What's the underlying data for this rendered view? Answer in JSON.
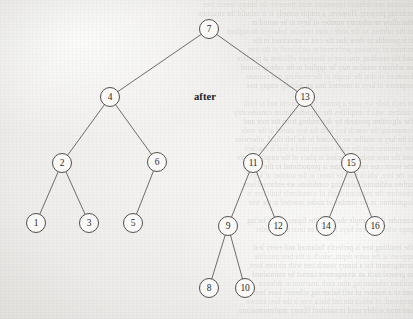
{
  "figure": {
    "caption_label": "after",
    "caption_x": 205,
    "caption_y": 91,
    "background_color": "#f2f1ef",
    "ink_color": "#3f3d3a",
    "node_fill": "#fbfaf8",
    "node_radius": 9.5
  },
  "chart_data": {
    "type": "diagram",
    "diagram_kind": "binary-search-tree",
    "title": "after",
    "node_count": 16,
    "root": 7,
    "nodes": [
      {
        "id": "n7",
        "label": "7",
        "x": 209,
        "y": 29,
        "depth": 0
      },
      {
        "id": "n4",
        "label": "4",
        "x": 110,
        "y": 97,
        "depth": 1
      },
      {
        "id": "n13",
        "label": "13",
        "x": 305,
        "y": 97,
        "depth": 1
      },
      {
        "id": "n2",
        "label": "2",
        "x": 62,
        "y": 163,
        "depth": 2
      },
      {
        "id": "n6",
        "label": "6",
        "x": 157,
        "y": 162,
        "depth": 2
      },
      {
        "id": "n11",
        "label": "11",
        "x": 253,
        "y": 163,
        "depth": 2
      },
      {
        "id": "n15",
        "label": "15",
        "x": 351,
        "y": 163,
        "depth": 2
      },
      {
        "id": "n1",
        "label": "1",
        "x": 36,
        "y": 223,
        "depth": 3
      },
      {
        "id": "n3",
        "label": "3",
        "x": 89,
        "y": 223,
        "depth": 3
      },
      {
        "id": "n5",
        "label": "5",
        "x": 133,
        "y": 223,
        "depth": 3
      },
      {
        "id": "n9",
        "label": "9",
        "x": 228,
        "y": 226,
        "depth": 3
      },
      {
        "id": "n12",
        "label": "12",
        "x": 278,
        "y": 226,
        "depth": 3
      },
      {
        "id": "n14",
        "label": "14",
        "x": 326,
        "y": 226,
        "depth": 3
      },
      {
        "id": "n16",
        "label": "16",
        "x": 375,
        "y": 226,
        "depth": 3
      },
      {
        "id": "n8",
        "label": "8",
        "x": 209,
        "y": 288,
        "depth": 4
      },
      {
        "id": "n10",
        "label": "10",
        "x": 245,
        "y": 288,
        "depth": 4
      }
    ],
    "edges": [
      {
        "from": "n7",
        "to": "n4",
        "side": "left"
      },
      {
        "from": "n7",
        "to": "n13",
        "side": "right"
      },
      {
        "from": "n4",
        "to": "n2",
        "side": "left"
      },
      {
        "from": "n4",
        "to": "n6",
        "side": "right"
      },
      {
        "from": "n13",
        "to": "n11",
        "side": "left"
      },
      {
        "from": "n13",
        "to": "n15",
        "side": "right"
      },
      {
        "from": "n2",
        "to": "n1",
        "side": "left"
      },
      {
        "from": "n2",
        "to": "n3",
        "side": "right"
      },
      {
        "from": "n6",
        "to": "n5",
        "side": "left"
      },
      {
        "from": "n11",
        "to": "n9",
        "side": "left"
      },
      {
        "from": "n11",
        "to": "n12",
        "side": "right"
      },
      {
        "from": "n15",
        "to": "n14",
        "side": "left"
      },
      {
        "from": "n15",
        "to": "n16",
        "side": "right"
      },
      {
        "from": "n9",
        "to": "n8",
        "side": "left"
      },
      {
        "from": "n9",
        "to": "n10",
        "side": "right"
      }
    ],
    "inorder_sequence": [
      1,
      2,
      3,
      4,
      5,
      6,
      7,
      8,
      9,
      10,
      11,
      12,
      13,
      14,
      15,
      16
    ]
  },
  "ghost_text": {
    "note": "faint mirrored bleed-through from reverse side of the scanned page",
    "lines": [
      {
        "y": 1,
        "text": "insertion and deletion operations must preserve the binary search tree"
      },
      {
        "y": 10,
        "text": "ordering property. However, a simple remedy is to rebuild the structure"
      },
      {
        "y": 19,
        "text": "that allow an arbitrary number of keys to be stored in"
      },
      {
        "y": 28,
        "text": "in the subtree, so the node count remains balanced throughout"
      },
      {
        "y": 37,
        "text": "it is possible to show that the cost is amortized in the"
      },
      {
        "y": 46,
        "text": "number of rotations performed at each level of the tree"
      },
      {
        "y": 55,
        "text": "and the resulting structure is therefore efficient in practice"
      },
      {
        "y": 64,
        "text": "an arbitrary rotation may be applied to the subtree rooted"
      },
      {
        "y": 73,
        "text": "balanced so that the height of the resulting tree remains"
      },
      {
        "y": 82,
        "text": "sequence of keys is inserted into an initially empty tree"
      },
      {
        "y": 100,
        "text": "at each node we store a pointer to the parent and to both"
      },
      {
        "y": 109,
        "text": "children, which simplifies the implementation considerably"
      },
      {
        "y": 118,
        "text": "the algorithm proceeds by descending from the root and"
      },
      {
        "y": 127,
        "text": "comparing the search key with the key stored at the node"
      },
      {
        "y": 136,
        "text": "if the key is smaller we descend to the left child, otherwise"
      },
      {
        "y": 145,
        "text": "we continue into the right subtree until a leaf is reached"
      },
      {
        "y": 154,
        "text": "and the new node is attached in place of the empty subtree"
      },
      {
        "y": 163,
        "text": "the worst case running time is proportional to the height"
      },
      {
        "y": 172,
        "text": "of the tree, which may be linear in the number of keys"
      },
      {
        "y": 181,
        "text": "unless additional balancing conditions are enforced here"
      },
      {
        "y": 190,
        "text": "therefore the expected depth of a randomly built tree is"
      },
      {
        "y": 199,
        "text": "logarithmic in the number of nodes inserted in the tree"
      },
      {
        "y": 217,
        "text": "consider the example shown in the figure on the facing"
      },
      {
        "y": 226,
        "text": "page where sixteen keys have been inserted in order"
      },
      {
        "y": 244,
        "text": "the resulting tree is perfectly balanced and every leaf"
      },
      {
        "y": 253,
        "text": "appears at the same depth, which is the best possible"
      },
      {
        "y": 262,
        "text": "arrangement for a binary search tree with sixteen keys"
      },
      {
        "y": 271,
        "text": "in general such an arrangement cannot be maintained"
      },
      {
        "y": 280,
        "text": "without rebalancing after each insertion or deletion"
      },
      {
        "y": 289,
        "text": "and so a number of self balancing schemes have been"
      },
      {
        "y": 298,
        "text": "proposed, of which the red black tree is the best known"
      },
      {
        "y": 307,
        "text": "and most widely used in standard library implementations"
      }
    ]
  }
}
